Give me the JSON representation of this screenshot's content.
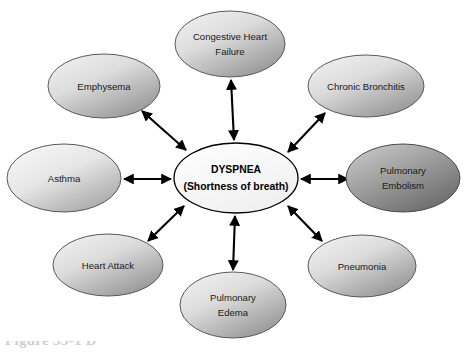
{
  "figure": {
    "type": "radial-concept-map",
    "background_color": "#ffffff",
    "caption_fragment": "Figure 33-1  D",
    "center": {
      "id": "dyspnea",
      "line1": "DYSPNEA",
      "line2": "(Shortness of breath)",
      "fill_from": "#ffffff",
      "fill_to": "#f2f2f2",
      "stroke": "#000000",
      "cx": 236,
      "cy": 178,
      "rx": 62,
      "ry": 35
    },
    "nodes": [
      {
        "id": "congestive-heart-failure",
        "line1": "Congestive Heart",
        "line2": "Failure",
        "cx": 230,
        "cy": 44,
        "rx": 55,
        "ry": 33,
        "fill_from": "#f0f0f0",
        "fill_to": "#9a9a9a",
        "stroke": "#5a5a5a"
      },
      {
        "id": "chronic-bronchitis",
        "line1": "Chronic Bronchitis",
        "line2": "",
        "cx": 366,
        "cy": 86,
        "rx": 58,
        "ry": 31,
        "fill_from": "#f0f0f0",
        "fill_to": "#9a9a9a",
        "stroke": "#5a5a5a"
      },
      {
        "id": "pulmonary-embolism",
        "line1": "Pulmonary",
        "line2": "Embolism",
        "cx": 403,
        "cy": 178,
        "rx": 57,
        "ry": 34,
        "fill_from": "#c8c8c8",
        "fill_to": "#6e6e6e",
        "stroke": "#4a4a4a"
      },
      {
        "id": "pneumonia",
        "line1": "Pneumonia",
        "line2": "",
        "cx": 362,
        "cy": 266,
        "rx": 54,
        "ry": 31,
        "fill_from": "#f0f0f0",
        "fill_to": "#9a9a9a",
        "stroke": "#5a5a5a"
      },
      {
        "id": "pulmonary-edema",
        "line1": "Pulmonary",
        "line2": "Edema",
        "cx": 233,
        "cy": 305,
        "rx": 53,
        "ry": 33,
        "fill_from": "#f0f0f0",
        "fill_to": "#9a9a9a",
        "stroke": "#5a5a5a"
      },
      {
        "id": "heart-attack",
        "line1": "Heart Attack",
        "line2": "",
        "cx": 108,
        "cy": 265,
        "rx": 55,
        "ry": 31,
        "fill_from": "#f0f0f0",
        "fill_to": "#9a9a9a",
        "stroke": "#5a5a5a"
      },
      {
        "id": "asthma",
        "line1": "Asthma",
        "line2": "",
        "cx": 64,
        "cy": 178,
        "rx": 57,
        "ry": 34,
        "fill_from": "#f4f4f4",
        "fill_to": "#a8a8a8",
        "stroke": "#5a5a5a"
      },
      {
        "id": "emphysema",
        "line1": "Emphysema",
        "line2": "",
        "cx": 104,
        "cy": 86,
        "rx": 56,
        "ry": 32,
        "fill_from": "#f0f0f0",
        "fill_to": "#9a9a9a",
        "stroke": "#5a5a5a"
      }
    ],
    "connectors": [
      {
        "id": "link-congestive-heart-failure",
        "from": "dyspnea",
        "to": "congestive-heart-failure",
        "style": "double-arrow",
        "x1": 234,
        "y1": 140,
        "x2": 231,
        "y2": 80
      },
      {
        "id": "link-chronic-bronchitis",
        "from": "dyspnea",
        "to": "chronic-bronchitis",
        "style": "double-arrow",
        "x1": 288,
        "y1": 152,
        "x2": 325,
        "y2": 113
      },
      {
        "id": "link-pulmonary-embolism",
        "from": "dyspnea",
        "to": "pulmonary-embolism",
        "style": "double-arrow",
        "x1": 301,
        "y1": 179,
        "x2": 348,
        "y2": 179
      },
      {
        "id": "link-pneumonia",
        "from": "dyspnea",
        "to": "pneumonia",
        "style": "double-arrow",
        "x1": 288,
        "y1": 206,
        "x2": 322,
        "y2": 241
      },
      {
        "id": "link-pulmonary-edema",
        "from": "dyspnea",
        "to": "pulmonary-edema",
        "style": "double-arrow",
        "x1": 235,
        "y1": 216,
        "x2": 233,
        "y2": 270
      },
      {
        "id": "link-heart-attack",
        "from": "dyspnea",
        "to": "heart-attack",
        "style": "double-arrow",
        "x1": 184,
        "y1": 206,
        "x2": 148,
        "y2": 241
      },
      {
        "id": "link-asthma",
        "from": "dyspnea",
        "to": "asthma",
        "style": "double-arrow",
        "x1": 171,
        "y1": 179,
        "x2": 124,
        "y2": 179
      },
      {
        "id": "link-emphysema",
        "from": "dyspnea",
        "to": "emphysema",
        "style": "double-arrow",
        "x1": 186,
        "y1": 150,
        "x2": 142,
        "y2": 111
      }
    ]
  }
}
